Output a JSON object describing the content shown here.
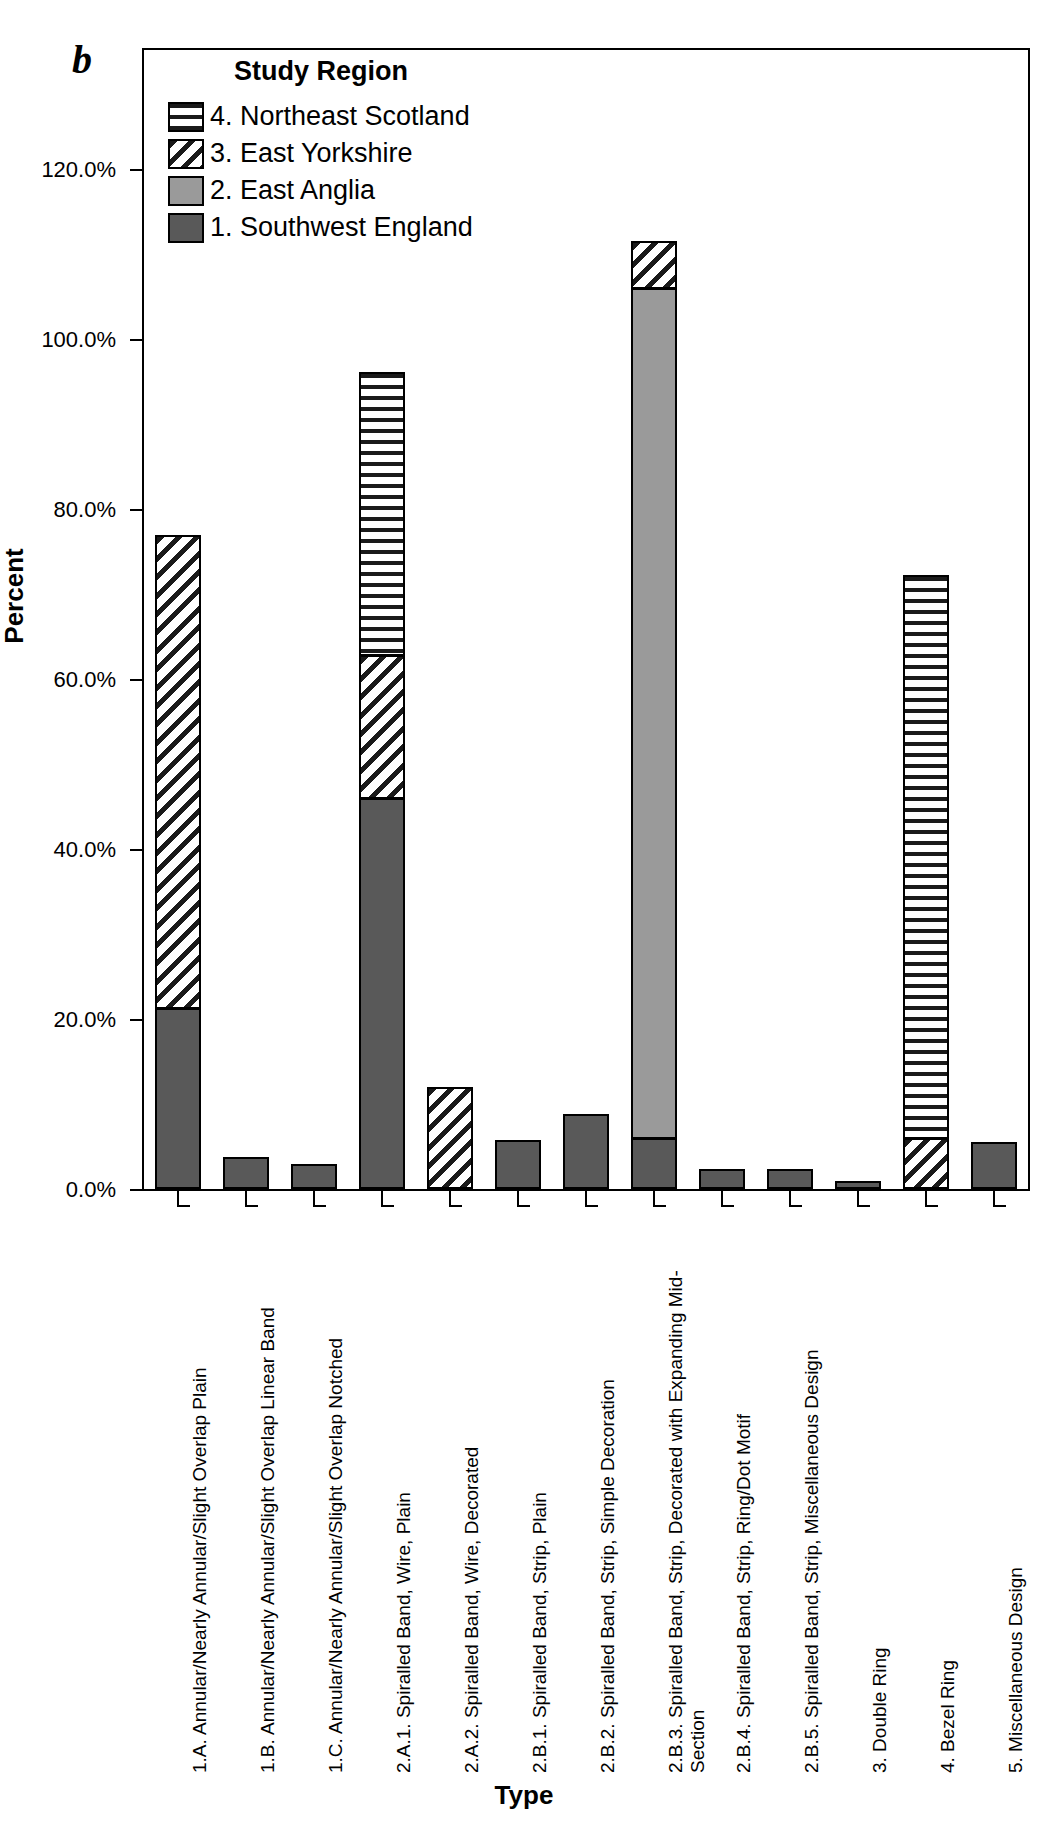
{
  "panel_label": "b",
  "legend": {
    "title": "Study Region",
    "entries": [
      {
        "label": "4. Northeast Scotland",
        "pattern": "horizontal-stripes",
        "color": "#ffffff"
      },
      {
        "label": "3. East Yorkshire",
        "pattern": "diagonal-stripes",
        "color": "#ffffff"
      },
      {
        "label": "2. East Anglia",
        "pattern": "solid",
        "color": "#9a9a9a"
      },
      {
        "label": "1. Southwest England",
        "pattern": "solid",
        "color": "#595959"
      }
    ]
  },
  "axes": {
    "y_title": "Percent",
    "x_title": "Type",
    "y_ticks": [
      "0.0%",
      "20.0%",
      "40.0%",
      "60.0%",
      "80.0%",
      "100.0%",
      "120.0%"
    ]
  },
  "chart_data": {
    "type": "bar",
    "subtype": "stacked-bar",
    "title": "",
    "xlabel": "Type",
    "ylabel": "Percent",
    "ylim": [
      0,
      130
    ],
    "ytick_values": [
      0,
      20,
      40,
      60,
      80,
      100,
      120
    ],
    "ytick_labels": [
      "0.0%",
      "20.0%",
      "40.0%",
      "60.0%",
      "80.0%",
      "100.0%",
      "120.0%"
    ],
    "grid": false,
    "legend_position": "inside-top-left",
    "legend_title": "Study Region",
    "categories": [
      "1.A. Annular/Nearly Annular/Slight Overlap Plain",
      "1.B. Annular/Nearly Annular/Slight Overlap Linear Band",
      "1.C. Annular/Nearly Annular/Slight Overlap Notched",
      "2.A.1. Spiralled Band, Wire, Plain",
      "2.A.2. Spiralled Band, Wire, Decorated",
      "2.B.1. Spiralled Band, Strip, Plain",
      "2.B.2. Spiralled Band, Strip, Simple Decoration",
      "2.B.3. Spiralled Band, Strip, Decorated with Expanding Mid-Section",
      "2.B.4. Spiralled Band, Strip, Ring/Dot Motif",
      "2.B.5. Spiralled Band, Strip, Miscellaneous Design",
      "3. Double Ring",
      "4. Bezel Ring",
      "5. Miscellaneous Design"
    ],
    "series": [
      {
        "name": "1. Southwest England",
        "pattern": "solid-dark",
        "values": [
          21.3,
          3.8,
          3.0,
          46.0,
          0.0,
          5.8,
          8.8,
          6.0,
          2.3,
          2.3,
          0.9,
          0.0,
          5.5
        ]
      },
      {
        "name": "2. East Anglia",
        "pattern": "solid-light",
        "values": [
          0.0,
          0.0,
          0.0,
          0.0,
          0.0,
          0.0,
          0.0,
          100.0,
          0.0,
          0.0,
          0.0,
          0.0,
          0.0
        ]
      },
      {
        "name": "3. East Yorkshire",
        "pattern": "diagonal",
        "values": [
          55.7,
          0.0,
          0.0,
          16.8,
          12.0,
          0.0,
          0.0,
          5.5,
          0.0,
          0.0,
          0.0,
          6.0,
          0.0
        ]
      },
      {
        "name": "4. Northeast Scotland",
        "pattern": "horizontal",
        "values": [
          0.0,
          0.0,
          0.0,
          33.3,
          0.0,
          0.0,
          0.0,
          0.0,
          0.0,
          0.0,
          0.0,
          66.2,
          0.0
        ]
      }
    ],
    "bar_totals": [
      77.0,
      3.8,
      3.0,
      96.1,
      12.0,
      5.8,
      8.8,
      111.5,
      2.3,
      2.3,
      0.9,
      72.2,
      5.5
    ]
  }
}
